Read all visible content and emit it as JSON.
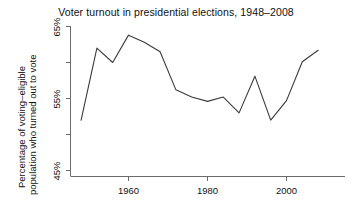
{
  "chart_data": {
    "type": "line",
    "title": "Voter turnout in presidential elections, 1948–2008",
    "xlabel": "",
    "ylabel": "Percentage of voting–eligible population who turned out to vote",
    "ylabel_line_1": "Percentage of voting–eligible",
    "ylabel_line_2": "population who turned out to vote",
    "x": [
      1948,
      1952,
      1956,
      1960,
      1964,
      1968,
      1972,
      1976,
      1980,
      1984,
      1988,
      1992,
      1996,
      2000,
      2004,
      2008
    ],
    "values": [
      52.0,
      62.0,
      60.0,
      63.8,
      62.8,
      61.5,
      56.2,
      55.2,
      54.6,
      55.2,
      53.0,
      58.1,
      52.0,
      54.7,
      60.1,
      61.7
    ],
    "categories": [
      "1948",
      "1952",
      "1956",
      "1960",
      "1964",
      "1968",
      "1972",
      "1976",
      "1980",
      "1984",
      "1988",
      "1992",
      "1996",
      "2000",
      "2004",
      "2008"
    ],
    "series": [
      {
        "name": "Voter turnout",
        "values": [
          52.0,
          62.0,
          60.0,
          63.8,
          62.8,
          61.5,
          56.2,
          55.2,
          54.6,
          55.2,
          53.0,
          58.1,
          52.0,
          54.7,
          60.1,
          61.7
        ]
      }
    ],
    "xlim": [
      1947,
      2009
    ],
    "ylim": [
      45,
      66
    ],
    "xticks": [
      1960,
      1980,
      2000
    ],
    "xtick_labels": [
      "1960",
      "1980",
      "2000"
    ],
    "yticks": [
      45,
      55,
      65
    ],
    "ytick_labels": [
      "45%",
      "55%",
      "65%"
    ],
    "yticks_minor": [
      50,
      60
    ],
    "grid": false,
    "legend": false,
    "line_color": "#3a3a3a",
    "axis_color": "#6b6b6b",
    "background_color": "#ffffff"
  },
  "axes": {
    "y_tick_label_0": "45%",
    "y_tick_label_1": "55%",
    "y_tick_label_2": "65%",
    "x_tick_label_0": "1960",
    "x_tick_label_1": "1980",
    "x_tick_label_2": "2000"
  }
}
